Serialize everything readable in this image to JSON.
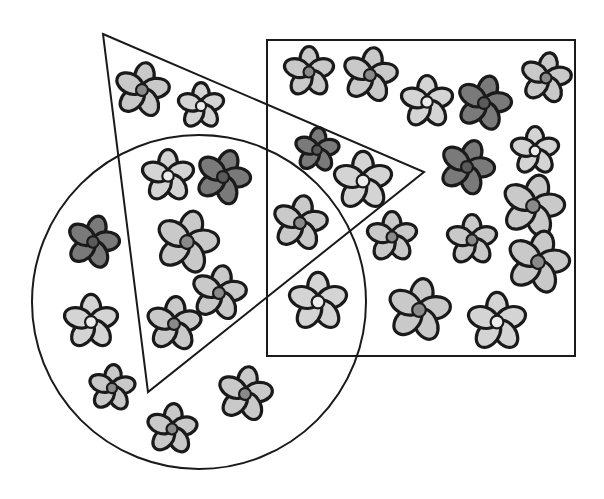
{
  "canvas": {
    "width": 604,
    "height": 499,
    "background": "#ffffff"
  },
  "colors": {
    "outline": "#1a1a1a",
    "types": {
      "A": {
        "petal": "#c9c9c9",
        "center": "#8a8a8a",
        "label": "light petals, gray center"
      },
      "B": {
        "petal": "#d4d4d4",
        "center": "#ececec",
        "label": "light petals, white center"
      },
      "C": {
        "petal": "#7a7a7a",
        "center": "#5a5a5a",
        "label": "dark petals, dark center"
      }
    }
  },
  "shapes": {
    "triangle": {
      "points": [
        [
          103,
          34
        ],
        [
          424,
          172
        ],
        [
          148,
          392
        ]
      ]
    },
    "square": {
      "x": 267,
      "y": 40,
      "width": 308,
      "height": 316
    },
    "circle": {
      "cx": 199,
      "cy": 302,
      "r": 167
    }
  },
  "flowers": [
    {
      "x": 142,
      "y": 90,
      "r": 27,
      "type": "A",
      "rot": 10
    },
    {
      "x": 201,
      "y": 106,
      "r": 23,
      "type": "B",
      "rot": 0
    },
    {
      "x": 168,
      "y": 176,
      "r": 26,
      "type": "B",
      "rot": 0
    },
    {
      "x": 223,
      "y": 177,
      "r": 27,
      "type": "C",
      "rot": 20
    },
    {
      "x": 309,
      "y": 72,
      "r": 25,
      "type": "A",
      "rot": 0
    },
    {
      "x": 370,
      "y": 75,
      "r": 27,
      "type": "A",
      "rot": 10
    },
    {
      "x": 427,
      "y": 102,
      "r": 26,
      "type": "B",
      "rot": 0
    },
    {
      "x": 484,
      "y": 103,
      "r": 27,
      "type": "C",
      "rot": 15
    },
    {
      "x": 546,
      "y": 78,
      "r": 25,
      "type": "A",
      "rot": 10
    },
    {
      "x": 317,
      "y": 150,
      "r": 22,
      "type": "C",
      "rot": 5
    },
    {
      "x": 363,
      "y": 181,
      "r": 29,
      "type": "B",
      "rot": 0
    },
    {
      "x": 467,
      "y": 167,
      "r": 27,
      "type": "C",
      "rot": 20
    },
    {
      "x": 535,
      "y": 151,
      "r": 24,
      "type": "B",
      "rot": 0
    },
    {
      "x": 533,
      "y": 206,
      "r": 31,
      "type": "A",
      "rot": 15
    },
    {
      "x": 300,
      "y": 223,
      "r": 27,
      "type": "A",
      "rot": 10
    },
    {
      "x": 392,
      "y": 237,
      "r": 25,
      "type": "A",
      "rot": 0
    },
    {
      "x": 472,
      "y": 240,
      "r": 25,
      "type": "A",
      "rot": 0
    },
    {
      "x": 538,
      "y": 262,
      "r": 31,
      "type": "A",
      "rot": 15
    },
    {
      "x": 318,
      "y": 302,
      "r": 29,
      "type": "B",
      "rot": 0
    },
    {
      "x": 419,
      "y": 310,
      "r": 31,
      "type": "A",
      "rot": 10
    },
    {
      "x": 497,
      "y": 322,
      "r": 29,
      "type": "B",
      "rot": 0
    },
    {
      "x": 93,
      "y": 242,
      "r": 26,
      "type": "C",
      "rot": 15
    },
    {
      "x": 187,
      "y": 242,
      "r": 31,
      "type": "A",
      "rot": 15
    },
    {
      "x": 219,
      "y": 293,
      "r": 27,
      "type": "A",
      "rot": 10
    },
    {
      "x": 91,
      "y": 322,
      "r": 27,
      "type": "B",
      "rot": 0
    },
    {
      "x": 174,
      "y": 324,
      "r": 27,
      "type": "A",
      "rot": 5
    },
    {
      "x": 112,
      "y": 388,
      "r": 23,
      "type": "A",
      "rot": 5
    },
    {
      "x": 245,
      "y": 394,
      "r": 27,
      "type": "A",
      "rot": 10
    },
    {
      "x": 172,
      "y": 429,
      "r": 25,
      "type": "A",
      "rot": 5
    }
  ]
}
